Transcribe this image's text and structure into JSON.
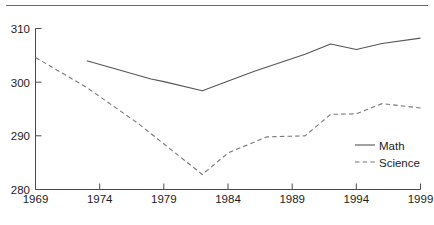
{
  "chart_data": {
    "type": "line",
    "title": "",
    "subtitle": "",
    "xlabel": "",
    "ylabel": "",
    "xlim": [
      1969,
      1999
    ],
    "ylim": [
      280,
      310
    ],
    "xticks": [
      1969,
      1974,
      1979,
      1984,
      1989,
      1994,
      1999
    ],
    "yticks": [
      280,
      290,
      300,
      310
    ],
    "xtick_labels": [
      "1969",
      "1974",
      "1979",
      "1984",
      "1989",
      "1994",
      "1999"
    ],
    "ytick_labels": [
      "280",
      "290",
      "300",
      "310"
    ],
    "grid": false,
    "legend_position": "lower right",
    "series": [
      {
        "name": "Math",
        "style": "solid",
        "color": "#555555",
        "x": [
          1973,
          1978,
          1979,
          1982,
          1986,
          1990,
          1992,
          1994,
          1996,
          1999
        ],
        "values": [
          304.0,
          300.6,
          300.1,
          298.4,
          302.0,
          305.2,
          307.1,
          306.1,
          307.2,
          308.2
        ]
      },
      {
        "name": "Science",
        "style": "dashed",
        "color": "#777777",
        "x": [
          1969,
          1973,
          1977,
          1982,
          1984,
          1987,
          1990,
          1992,
          1994,
          1996,
          1999
        ],
        "values": [
          304.6,
          299.0,
          292.3,
          282.8,
          286.8,
          289.8,
          290.0,
          294.0,
          294.1,
          296.0,
          295.2
        ]
      }
    ]
  },
  "legend": {
    "items": [
      {
        "label": "Math"
      },
      {
        "label": "Science"
      }
    ]
  },
  "axes": {
    "y_labels": [
      "310",
      "300",
      "290",
      "280"
    ],
    "x_labels": [
      "1969",
      "1974",
      "1979",
      "1984",
      "1989",
      "1994",
      "1999"
    ]
  }
}
